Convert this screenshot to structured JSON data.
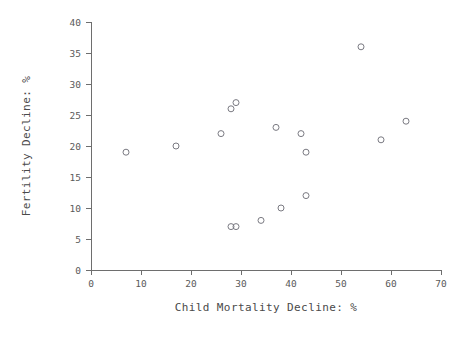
{
  "chart_data": {
    "type": "scatter",
    "title": "",
    "xlabel": "Child Mortality Decline: %",
    "ylabel": "Fertility Decline: %",
    "xlim": [
      0,
      70
    ],
    "ylim": [
      0,
      40
    ],
    "xticks": [
      0,
      10,
      20,
      30,
      40,
      50,
      60,
      70
    ],
    "yticks": [
      0,
      5,
      10,
      15,
      20,
      25,
      30,
      35,
      40
    ],
    "grid": false,
    "legend": null,
    "marker": "open-circle",
    "marker_color": "#7a7a82",
    "points": [
      {
        "x": 7,
        "y": 19
      },
      {
        "x": 17,
        "y": 20
      },
      {
        "x": 26,
        "y": 22
      },
      {
        "x": 28,
        "y": 26
      },
      {
        "x": 29,
        "y": 27
      },
      {
        "x": 28,
        "y": 7
      },
      {
        "x": 29,
        "y": 7
      },
      {
        "x": 34,
        "y": 8
      },
      {
        "x": 37,
        "y": 23
      },
      {
        "x": 38,
        "y": 10
      },
      {
        "x": 42,
        "y": 22
      },
      {
        "x": 43,
        "y": 19
      },
      {
        "x": 43,
        "y": 12
      },
      {
        "x": 54,
        "y": 36
      },
      {
        "x": 58,
        "y": 21
      },
      {
        "x": 63,
        "y": 24
      }
    ]
  },
  "axes": {
    "x_tick_labels": [
      "0",
      "10",
      "20",
      "30",
      "40",
      "50",
      "60",
      "70"
    ],
    "y_tick_labels": [
      "0",
      "5",
      "10",
      "15",
      "20",
      "25",
      "30",
      "35",
      "40"
    ],
    "x_axis_title": "Child Mortality Decline: %",
    "y_axis_title": "Fertility Decline: %"
  },
  "colors": {
    "axis": "#6e6e6e",
    "text": "#4a4a4a",
    "marker": "#7a7a82",
    "background": "#ffffff"
  }
}
